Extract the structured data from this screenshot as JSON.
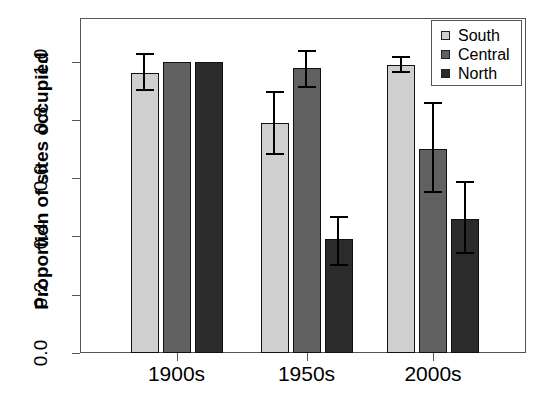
{
  "chart_data": {
    "type": "bar",
    "title": "",
    "xlabel": "",
    "ylabel": "Proportion of sites occupied",
    "categories": [
      "1900s",
      "1950s",
      "2000s"
    ],
    "ylim": [
      0.0,
      1.15
    ],
    "yticks": [
      0.0,
      0.2,
      0.4,
      0.6,
      0.8,
      1.0
    ],
    "ytick_labels": [
      "0.0",
      "0.2",
      "0.4",
      "0.6",
      "0.8",
      "1.0"
    ],
    "grid": false,
    "legend_position": "top-right",
    "error_bars": "asymmetric 95% confidence intervals",
    "series": [
      {
        "name": "South",
        "color": "#cfcfcf",
        "values": [
          0.96,
          0.79,
          0.99
        ],
        "err_low": [
          0.9,
          0.68,
          0.96
        ],
        "err_high": [
          1.03,
          0.9,
          1.02
        ]
      },
      {
        "name": "Central",
        "color": "#616161",
        "values": [
          1.0,
          0.98,
          0.7
        ],
        "err_low": [
          null,
          0.91,
          0.55
        ],
        "err_high": [
          null,
          1.04,
          0.86
        ]
      },
      {
        "name": "North",
        "color": "#2b2b2b",
        "values": [
          1.0,
          0.39,
          0.46
        ],
        "err_low": [
          null,
          0.3,
          0.34
        ],
        "err_high": [
          null,
          0.47,
          0.59
        ]
      }
    ]
  },
  "legend": {
    "entries": [
      {
        "label": "South",
        "color": "#cfcfcf"
      },
      {
        "label": "Central",
        "color": "#616161"
      },
      {
        "label": "North",
        "color": "#2b2b2b"
      }
    ]
  },
  "axes": {
    "y_title": "Proportion of sites occupied",
    "y_tick_labels": [
      "0.0",
      "0.2",
      "0.4",
      "0.6",
      "0.8",
      "1.0"
    ],
    "x_tick_labels": [
      "1900s",
      "1950s",
      "2000s"
    ]
  },
  "caption_sliver": ""
}
